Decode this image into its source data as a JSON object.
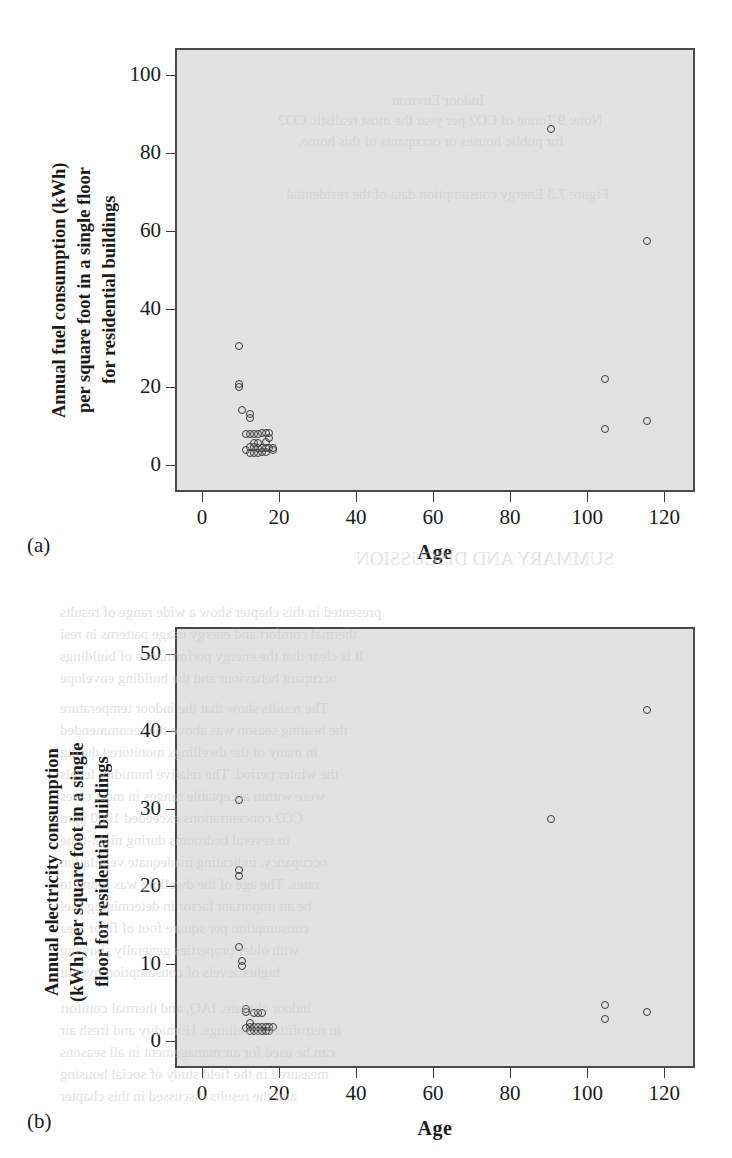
{
  "page": {
    "width": 732,
    "height": 1158,
    "background": "#ffffff",
    "plot_background": "#e2e2e2",
    "marker_color": "#3a3a3a",
    "axis_color": "#4a4a4a"
  },
  "bleed_text": [
    {
      "text": "Indoor Environ",
      "x": 392,
      "y": 92,
      "size": 15
    },
    {
      "text": "Note: 9 Tonne of CO2 per year the most realistic CO2",
      "x": 278,
      "y": 112,
      "size": 15
    },
    {
      "text": "for public houses or occupants of this home.",
      "x": 298,
      "y": 133,
      "size": 15
    },
    {
      "text": "Figure 7.3  Energy consumption data of the residential",
      "x": 286,
      "y": 186,
      "size": 15
    },
    {
      "text": "SUMMARY AND DISCUSSION",
      "x": 356,
      "y": 548,
      "size": 19
    },
    {
      "text": "presented in this chapter show a wide range of results",
      "x": 60,
      "y": 604,
      "size": 15
    },
    {
      "text": "thermal comfort and energy usage patterns in resi",
      "x": 60,
      "y": 626,
      "size": 15
    },
    {
      "text": "It is clear that the energy performance of buildings",
      "x": 60,
      "y": 648,
      "size": 15
    },
    {
      "text": "occupant behaviour and the building envelope",
      "x": 60,
      "y": 670,
      "size": 15
    },
    {
      "text": "The results show that the indoor temperature",
      "x": 60,
      "y": 700,
      "size": 15
    },
    {
      "text": "the heating season was above the recommended",
      "x": 60,
      "y": 722,
      "size": 15
    },
    {
      "text": "in many of the dwellings monitored during",
      "x": 60,
      "y": 744,
      "size": 15
    },
    {
      "text": "the winter period. The relative humidity levels",
      "x": 60,
      "y": 766,
      "size": 15
    },
    {
      "text": "were within acceptable ranges in most cases",
      "x": 60,
      "y": 788,
      "size": 15
    },
    {
      "text": "CO2 concentrations exceeded 1000 ppm",
      "x": 60,
      "y": 810,
      "size": 15
    },
    {
      "text": "in several bedrooms during night-time",
      "x": 60,
      "y": 832,
      "size": 15
    },
    {
      "text": "occupancy, indicating inadequate ventilation",
      "x": 60,
      "y": 854,
      "size": 15
    },
    {
      "text": "rates. The age of the dwelling was found to",
      "x": 60,
      "y": 876,
      "size": 15
    },
    {
      "text": "be an important factor in determining fuel",
      "x": 60,
      "y": 898,
      "size": 15
    },
    {
      "text": "consumption per square foot of floor area",
      "x": 60,
      "y": 920,
      "size": 15
    },
    {
      "text": "with older properties generally showing",
      "x": 60,
      "y": 942,
      "size": 15
    },
    {
      "text": "higher levels of consumption overall",
      "x": 60,
      "y": 964,
      "size": 15
    },
    {
      "text": "indoor climate, IAQ, and thermal comfort",
      "x": 60,
      "y": 1000,
      "size": 15
    },
    {
      "text": "in retrofitted dwellings. Humidity and fresh air",
      "x": 60,
      "y": 1022,
      "size": 15
    },
    {
      "text": "can be used for air management in all seasons",
      "x": 60,
      "y": 1044,
      "size": 15
    },
    {
      "text": "measured in the field study of social housing",
      "x": 60,
      "y": 1066,
      "size": 15
    },
    {
      "text": "and the results discussed in this chapter",
      "x": 60,
      "y": 1088,
      "size": 15
    }
  ],
  "chart_data": [
    {
      "id": "a",
      "type": "scatter",
      "panel_label": "(a)",
      "title": "",
      "xlabel": "Age",
      "ylabel": "Annual fuel consumption (kWh)\nper square foot in a single floor\nfor residential buildings",
      "xlim": [
        -7,
        128
      ],
      "ylim": [
        -7,
        107
      ],
      "xticks": [
        0,
        20,
        40,
        60,
        80,
        100,
        120
      ],
      "yticks": [
        0,
        20,
        40,
        60,
        80,
        100
      ],
      "grid": false,
      "legend": null,
      "points": [
        {
          "x": 9,
          "y": 31.0
        },
        {
          "x": 9,
          "y": 21.2
        },
        {
          "x": 9,
          "y": 20.4
        },
        {
          "x": 10,
          "y": 14.6
        },
        {
          "x": 12,
          "y": 13.6
        },
        {
          "x": 12,
          "y": 12.4
        },
        {
          "x": 11,
          "y": 8.5
        },
        {
          "x": 12,
          "y": 8.5
        },
        {
          "x": 13,
          "y": 8.5
        },
        {
          "x": 14,
          "y": 8.5
        },
        {
          "x": 15,
          "y": 8.6
        },
        {
          "x": 16,
          "y": 8.6
        },
        {
          "x": 17,
          "y": 8.6
        },
        {
          "x": 17,
          "y": 7.3
        },
        {
          "x": 13,
          "y": 6.2
        },
        {
          "x": 14,
          "y": 6.0
        },
        {
          "x": 16,
          "y": 6.4
        },
        {
          "x": 12,
          "y": 5.0
        },
        {
          "x": 13,
          "y": 5.0
        },
        {
          "x": 14,
          "y": 4.8
        },
        {
          "x": 15,
          "y": 4.8
        },
        {
          "x": 16,
          "y": 4.8
        },
        {
          "x": 17,
          "y": 4.8
        },
        {
          "x": 18,
          "y": 4.8
        },
        {
          "x": 12,
          "y": 3.6
        },
        {
          "x": 13,
          "y": 3.6
        },
        {
          "x": 14,
          "y": 3.6
        },
        {
          "x": 15,
          "y": 3.7
        },
        {
          "x": 16,
          "y": 3.7
        },
        {
          "x": 11,
          "y": 4.3
        },
        {
          "x": 18,
          "y": 4.2
        },
        {
          "x": 90,
          "y": 86.8
        },
        {
          "x": 115,
          "y": 58.0
        },
        {
          "x": 104,
          "y": 22.4
        },
        {
          "x": 104,
          "y": 9.8
        },
        {
          "x": 115,
          "y": 11.8
        }
      ]
    },
    {
      "id": "b",
      "type": "scatter",
      "panel_label": "(b)",
      "title": "",
      "xlabel": "Age",
      "ylabel": "Annual electricity consumption\n(kWh) per square foot in a single\nfloor for residential buildings",
      "xlim": [
        -7,
        128
      ],
      "ylim": [
        -3.5,
        53.5
      ],
      "xticks": [
        0,
        20,
        40,
        60,
        80,
        100,
        120
      ],
      "yticks": [
        0,
        10,
        20,
        30,
        40,
        50
      ],
      "grid": false,
      "legend": null,
      "points": [
        {
          "x": 9,
          "y": 31.4
        },
        {
          "x": 9,
          "y": 22.4
        },
        {
          "x": 9,
          "y": 21.6
        },
        {
          "x": 9,
          "y": 12.4
        },
        {
          "x": 10,
          "y": 10.6
        },
        {
          "x": 10,
          "y": 9.9
        },
        {
          "x": 11,
          "y": 4.4
        },
        {
          "x": 11,
          "y": 4.0
        },
        {
          "x": 13,
          "y": 3.9
        },
        {
          "x": 14,
          "y": 3.9
        },
        {
          "x": 15,
          "y": 3.9
        },
        {
          "x": 12,
          "y": 2.6
        },
        {
          "x": 12,
          "y": 2.1
        },
        {
          "x": 13,
          "y": 2.0
        },
        {
          "x": 14,
          "y": 2.0
        },
        {
          "x": 15,
          "y": 2.0
        },
        {
          "x": 16,
          "y": 2.0
        },
        {
          "x": 17,
          "y": 2.0
        },
        {
          "x": 18,
          "y": 2.0
        },
        {
          "x": 12,
          "y": 1.5
        },
        {
          "x": 13,
          "y": 1.5
        },
        {
          "x": 14,
          "y": 1.5
        },
        {
          "x": 15,
          "y": 1.6
        },
        {
          "x": 16,
          "y": 1.6
        },
        {
          "x": 11,
          "y": 1.9
        },
        {
          "x": 17,
          "y": 1.6
        },
        {
          "x": 115,
          "y": 43.0
        },
        {
          "x": 90,
          "y": 29.0
        },
        {
          "x": 104,
          "y": 4.9
        },
        {
          "x": 104,
          "y": 3.1
        },
        {
          "x": 115,
          "y": 4.0
        }
      ]
    }
  ]
}
